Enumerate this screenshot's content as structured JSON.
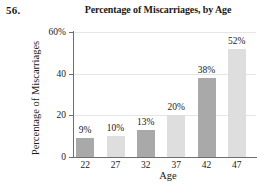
{
  "problem": {
    "number": "56."
  },
  "chart_data": {
    "type": "bar",
    "title": "Percentage of Miscarriages, by Age",
    "xlabel": "Age",
    "ylabel": "Percentage of Miscarriages",
    "categories": [
      "22",
      "27",
      "32",
      "37",
      "42",
      "47"
    ],
    "values": [
      9,
      10,
      13,
      20,
      38,
      52
    ],
    "data_labels": [
      "9%",
      "10%",
      "13%",
      "20%",
      "38%",
      "52%"
    ],
    "bar_colors": [
      "#a9a9a9",
      "#dedede",
      "#a9a9a9",
      "#dedede",
      "#a9a9a9",
      "#dedede"
    ],
    "ylim": [
      0,
      60
    ],
    "yticks": [
      0,
      20,
      40,
      60
    ],
    "ytick_labels": [
      "0",
      "20",
      "40",
      "60%"
    ],
    "grid": true,
    "grid_axis": "y",
    "legend": "none",
    "axis_color": "#6e6e6e",
    "grid_color": "#e6e6e6"
  }
}
